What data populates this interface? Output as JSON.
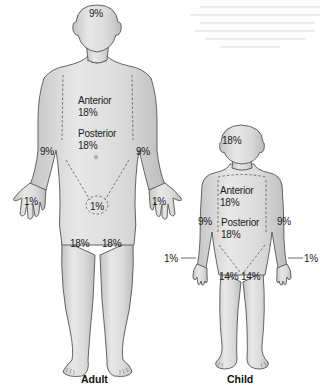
{
  "diagram": {
    "colors": {
      "skin": "#d4d4d4",
      "skin_light": "#ececec",
      "outline": "#555555",
      "text": "#1a1a1a",
      "dash": "#666666"
    },
    "adult": {
      "caption": "Adult",
      "labels": {
        "head": "9%",
        "trunk_anterior_label": "Anterior",
        "trunk_anterior_value": "18%",
        "trunk_posterior_label": "Posterior",
        "trunk_posterior_value": "18%",
        "arm_left": "9%",
        "arm_right": "9%",
        "hand_left": "1%",
        "hand_right": "1%",
        "perineum": "1%",
        "leg_left": "18%",
        "leg_right": "18%"
      }
    },
    "child": {
      "caption": "Child",
      "labels": {
        "head": "18%",
        "trunk_anterior_label": "Anterior",
        "trunk_anterior_value": "18%",
        "trunk_posterior_label": "Posterior",
        "trunk_posterior_value": "18%",
        "arm_left": "9%",
        "arm_right": "9%",
        "hand_left": "1%",
        "hand_right": "1%",
        "leg_left": "14%",
        "leg_right": "14%"
      }
    }
  }
}
